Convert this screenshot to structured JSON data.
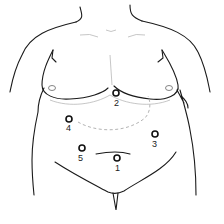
{
  "figure": {
    "ports": [
      {
        "label": "1",
        "x": 117,
        "y": 158
      },
      {
        "label": "2",
        "x": 116,
        "y": 93
      },
      {
        "label": "3",
        "x": 155,
        "y": 134
      },
      {
        "label": "4",
        "x": 69,
        "y": 119
      },
      {
        "label": "5",
        "x": 82,
        "y": 148
      }
    ]
  }
}
